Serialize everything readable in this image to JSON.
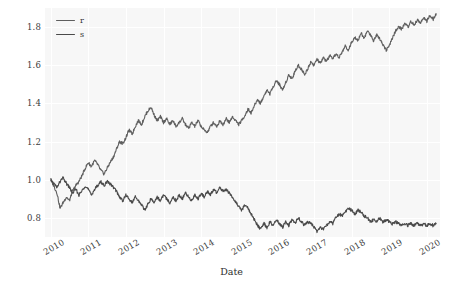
{
  "chart_data": {
    "type": "line",
    "title": "",
    "xlabel": "Date",
    "ylabel": "",
    "grid": true,
    "legend_position": "upper-left",
    "xlim": [
      2009.85,
      2020.35
    ],
    "ylim": [
      0.7,
      1.9
    ],
    "yticks": [
      "0.8",
      "1.0",
      "1.2",
      "1.4",
      "1.6",
      "1.8"
    ],
    "ytick_values": [
      0.8,
      1.0,
      1.2,
      1.4,
      1.6,
      1.8
    ],
    "xticks": [
      "2010",
      "2011",
      "2012",
      "2013",
      "2014",
      "2015",
      "2016",
      "2017",
      "2018",
      "2019",
      "2020"
    ],
    "xtick_values": [
      2010,
      2011,
      2012,
      2013,
      2014,
      2015,
      2016,
      2017,
      2018,
      2019,
      2020
    ],
    "colors": {
      "series_r": "#5f5f5f",
      "series_s": "#4a4a4a",
      "plot_background": "#f7f7f7",
      "grid": "#ffffff",
      "figure_background": "#ffffff",
      "tick_text": "#3b3b3b"
    },
    "series": [
      {
        "name": "r",
        "color": "#5f5f5f",
        "x": [
          2010.0,
          2010.08,
          2010.17,
          2010.25,
          2010.33,
          2010.42,
          2010.5,
          2010.58,
          2010.67,
          2010.75,
          2010.83,
          2010.92,
          2011.0,
          2011.08,
          2011.17,
          2011.25,
          2011.33,
          2011.42,
          2011.5,
          2011.58,
          2011.67,
          2011.75,
          2011.83,
          2011.92,
          2012.0,
          2012.08,
          2012.17,
          2012.25,
          2012.33,
          2012.42,
          2012.5,
          2012.58,
          2012.67,
          2012.75,
          2012.83,
          2012.92,
          2013.0,
          2013.08,
          2013.17,
          2013.25,
          2013.33,
          2013.42,
          2013.5,
          2013.58,
          2013.67,
          2013.75,
          2013.83,
          2013.92,
          2014.0,
          2014.08,
          2014.17,
          2014.25,
          2014.33,
          2014.42,
          2014.5,
          2014.58,
          2014.67,
          2014.75,
          2014.83,
          2014.92,
          2015.0,
          2015.08,
          2015.17,
          2015.25,
          2015.33,
          2015.42,
          2015.5,
          2015.58,
          2015.67,
          2015.75,
          2015.83,
          2015.92,
          2016.0,
          2016.08,
          2016.17,
          2016.25,
          2016.33,
          2016.42,
          2016.5,
          2016.58,
          2016.67,
          2016.75,
          2016.83,
          2016.92,
          2017.0,
          2017.08,
          2017.17,
          2017.25,
          2017.33,
          2017.42,
          2017.5,
          2017.58,
          2017.67,
          2017.75,
          2017.83,
          2017.92,
          2018.0,
          2018.08,
          2018.17,
          2018.25,
          2018.33,
          2018.42,
          2018.5,
          2018.58,
          2018.67,
          2018.75,
          2018.83,
          2018.92,
          2019.0,
          2019.08,
          2019.17,
          2019.25,
          2019.33,
          2019.42,
          2019.5,
          2019.58,
          2019.67,
          2019.75,
          2019.83,
          2019.92,
          2020.0,
          2020.08,
          2020.17,
          2020.25
        ],
        "y": [
          1.0,
          0.97,
          0.93,
          0.85,
          0.88,
          0.91,
          0.89,
          0.94,
          0.97,
          0.99,
          1.02,
          1.06,
          1.09,
          1.07,
          1.1,
          1.08,
          1.05,
          1.03,
          1.06,
          1.09,
          1.12,
          1.16,
          1.2,
          1.19,
          1.22,
          1.26,
          1.24,
          1.28,
          1.31,
          1.29,
          1.33,
          1.36,
          1.38,
          1.34,
          1.31,
          1.33,
          1.3,
          1.32,
          1.29,
          1.31,
          1.28,
          1.3,
          1.32,
          1.29,
          1.27,
          1.3,
          1.28,
          1.31,
          1.28,
          1.26,
          1.25,
          1.28,
          1.3,
          1.28,
          1.31,
          1.29,
          1.32,
          1.3,
          1.33,
          1.31,
          1.29,
          1.31,
          1.34,
          1.37,
          1.35,
          1.39,
          1.42,
          1.4,
          1.44,
          1.47,
          1.45,
          1.49,
          1.52,
          1.5,
          1.47,
          1.51,
          1.55,
          1.53,
          1.57,
          1.6,
          1.58,
          1.55,
          1.58,
          1.62,
          1.6,
          1.63,
          1.61,
          1.64,
          1.62,
          1.65,
          1.63,
          1.66,
          1.64,
          1.67,
          1.7,
          1.68,
          1.72,
          1.75,
          1.73,
          1.77,
          1.74,
          1.78,
          1.76,
          1.73,
          1.76,
          1.74,
          1.71,
          1.68,
          1.7,
          1.74,
          1.78,
          1.8,
          1.79,
          1.82,
          1.8,
          1.83,
          1.81,
          1.84,
          1.82,
          1.85,
          1.83,
          1.86,
          1.84,
          1.87
        ],
        "start_value": 1.0,
        "end_value": 1.87,
        "min_value": 0.85,
        "max_value": 1.87
      },
      {
        "name": "s",
        "color": "#4a4a4a",
        "x": [
          2010.0,
          2010.08,
          2010.17,
          2010.25,
          2010.33,
          2010.42,
          2010.5,
          2010.58,
          2010.67,
          2010.75,
          2010.83,
          2010.92,
          2011.0,
          2011.08,
          2011.17,
          2011.25,
          2011.33,
          2011.42,
          2011.5,
          2011.58,
          2011.67,
          2011.75,
          2011.83,
          2011.92,
          2012.0,
          2012.08,
          2012.17,
          2012.25,
          2012.33,
          2012.42,
          2012.5,
          2012.58,
          2012.67,
          2012.75,
          2012.83,
          2012.92,
          2013.0,
          2013.08,
          2013.17,
          2013.25,
          2013.33,
          2013.42,
          2013.5,
          2013.58,
          2013.67,
          2013.75,
          2013.83,
          2013.92,
          2014.0,
          2014.08,
          2014.17,
          2014.25,
          2014.33,
          2014.42,
          2014.5,
          2014.58,
          2014.67,
          2014.75,
          2014.83,
          2014.92,
          2015.0,
          2015.08,
          2015.17,
          2015.25,
          2015.33,
          2015.42,
          2015.5,
          2015.58,
          2015.67,
          2015.75,
          2015.83,
          2015.92,
          2016.0,
          2016.08,
          2016.17,
          2016.25,
          2016.33,
          2016.42,
          2016.5,
          2016.58,
          2016.67,
          2016.75,
          2016.83,
          2016.92,
          2017.0,
          2017.08,
          2017.17,
          2017.25,
          2017.33,
          2017.42,
          2017.5,
          2017.58,
          2017.67,
          2017.75,
          2017.83,
          2017.92,
          2018.0,
          2018.08,
          2018.17,
          2018.25,
          2018.33,
          2018.42,
          2018.5,
          2018.58,
          2018.67,
          2018.75,
          2018.83,
          2018.92,
          2019.0,
          2019.08,
          2019.17,
          2019.25,
          2019.33,
          2019.42,
          2019.5,
          2019.58,
          2019.67,
          2019.75,
          2019.83,
          2019.92,
          2020.0,
          2020.08,
          2020.17,
          2020.25
        ],
        "y": [
          1.0,
          0.98,
          0.96,
          0.99,
          1.01,
          0.98,
          0.96,
          0.93,
          0.95,
          0.92,
          0.94,
          0.97,
          0.95,
          0.92,
          0.95,
          0.97,
          0.99,
          0.97,
          0.99,
          0.98,
          0.96,
          0.94,
          0.91,
          0.89,
          0.92,
          0.9,
          0.88,
          0.91,
          0.89,
          0.87,
          0.84,
          0.87,
          0.9,
          0.88,
          0.91,
          0.89,
          0.92,
          0.9,
          0.88,
          0.91,
          0.89,
          0.92,
          0.9,
          0.93,
          0.91,
          0.89,
          0.92,
          0.9,
          0.93,
          0.91,
          0.94,
          0.92,
          0.95,
          0.93,
          0.96,
          0.94,
          0.95,
          0.93,
          0.91,
          0.88,
          0.86,
          0.84,
          0.87,
          0.85,
          0.82,
          0.79,
          0.76,
          0.74,
          0.77,
          0.75,
          0.78,
          0.76,
          0.79,
          0.77,
          0.75,
          0.78,
          0.76,
          0.79,
          0.77,
          0.8,
          0.78,
          0.76,
          0.78,
          0.77,
          0.75,
          0.73,
          0.75,
          0.74,
          0.76,
          0.78,
          0.77,
          0.8,
          0.82,
          0.81,
          0.83,
          0.85,
          0.84,
          0.82,
          0.84,
          0.83,
          0.81,
          0.8,
          0.78,
          0.79,
          0.78,
          0.8,
          0.78,
          0.79,
          0.78,
          0.77,
          0.78,
          0.77,
          0.76,
          0.77,
          0.76,
          0.77,
          0.76,
          0.77,
          0.76,
          0.77,
          0.76,
          0.77,
          0.76,
          0.77
        ],
        "start_value": 1.0,
        "end_value": 0.77,
        "min_value": 0.73,
        "max_value": 1.01
      }
    ]
  },
  "legend": {
    "entries": [
      {
        "label": "r",
        "color": "#5f5f5f"
      },
      {
        "label": "s",
        "color": "#4a4a4a"
      }
    ]
  },
  "axes": {
    "xlabel": "Date",
    "ytick_labels": [
      "1.8",
      "1.6",
      "1.4",
      "1.2",
      "1.0",
      "0.8"
    ],
    "xtick_labels": [
      "2010",
      "2011",
      "2012",
      "2013",
      "2014",
      "2015",
      "2016",
      "2017",
      "2018",
      "2019",
      "2020"
    ]
  }
}
